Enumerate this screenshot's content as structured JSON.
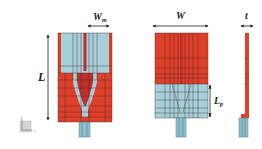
{
  "diagram": {
    "type": "antenna-geometry",
    "views": [
      {
        "id": "front",
        "top_region": "light-blue",
        "bottom_region": "red"
      },
      {
        "id": "back",
        "top_region": "red",
        "bottom_region": "light-blue"
      },
      {
        "id": "side"
      }
    ],
    "labels": {
      "wm": {
        "main": "W",
        "sub": "m"
      },
      "w": "W",
      "t": "t",
      "l": "L",
      "lp": {
        "main": "L",
        "sub": "p"
      }
    },
    "axis_icon": {
      "x": "x",
      "y": "y",
      "z": "z"
    },
    "colors": {
      "copper_red": "#e0402a",
      "substrate_blue": "#a8d0dc",
      "grid_dark": "#3a2a2a",
      "feed_blue": "#8ec1cf",
      "arrow": "#222222"
    }
  }
}
